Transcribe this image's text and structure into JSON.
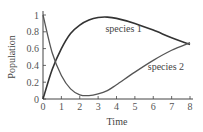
{
  "chart_data": {
    "type": "line",
    "title": "",
    "xlabel": "Time",
    "ylabel": "Population",
    "xlim": [
      0,
      8
    ],
    "ylim": [
      0,
      1
    ],
    "xticks": [
      "0",
      "1",
      "2",
      "3",
      "4",
      "5",
      "6",
      "7",
      "8"
    ],
    "yticks": [
      "0",
      "0.2",
      "0.4",
      "0.6",
      "0.8",
      "1"
    ],
    "grid": false,
    "legend": "inline labels",
    "series": [
      {
        "name": "species 1",
        "color": "#333333",
        "x": [
          0,
          0.5,
          1,
          1.5,
          2,
          2.5,
          3,
          3.5,
          4,
          5,
          6,
          7,
          8
        ],
        "values": [
          0,
          0.35,
          0.6,
          0.78,
          0.88,
          0.94,
          0.97,
          0.975,
          0.96,
          0.9,
          0.82,
          0.73,
          0.65
        ]
      },
      {
        "name": "species 2",
        "color": "#555555",
        "x": [
          0,
          0.5,
          1,
          1.5,
          2,
          2.5,
          3,
          3.5,
          4,
          5,
          6,
          7,
          8
        ],
        "values": [
          1,
          0.55,
          0.28,
          0.12,
          0.05,
          0.04,
          0.06,
          0.1,
          0.17,
          0.32,
          0.46,
          0.58,
          0.67
        ]
      }
    ],
    "annotations": [
      {
        "text": "species 1",
        "x": 3.4,
        "y": 0.8
      },
      {
        "text": "species 2",
        "x": 5.7,
        "y": 0.35
      }
    ]
  }
}
